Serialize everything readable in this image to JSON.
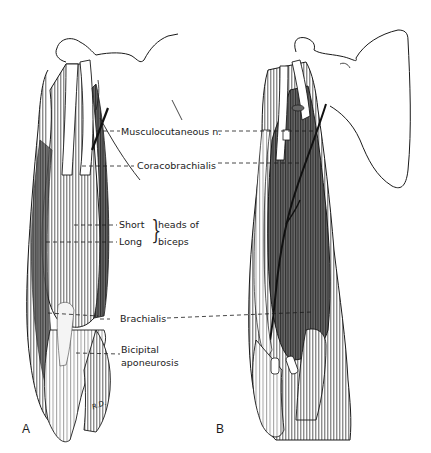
{
  "figure": {
    "panels": [
      {
        "letter": "A",
        "description": "anterior view of arm, superficial muscles (biceps intact)"
      },
      {
        "letter": "B",
        "description": "anterior view of arm, biceps removed showing brachialis and coracobrachialis"
      }
    ],
    "labels": {
      "musculocutaneous": "Musculocutaneous n.",
      "coracobrachialis": "Coracobrachialis",
      "short": "Short",
      "long": "Long",
      "heads_of_line1": "heads of",
      "heads_of_line2": "biceps",
      "brachialis": "Brachialis",
      "bicipital_line1": "Bicipital",
      "bicipital_line2": "aponeurosis",
      "signature": "R.D."
    },
    "colors": {
      "ink": "#1a1a1a",
      "muscle_dark": "#555555",
      "muscle_mid": "#8a8a8a",
      "background": "#ffffff"
    }
  }
}
